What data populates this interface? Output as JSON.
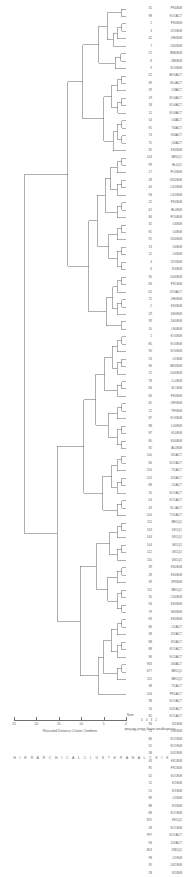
{
  "chart_data": {
    "type": "dendrogram",
    "title": "Dendrogram using Ward Method",
    "xlabel": "Rescaled Distance Cluster Combine",
    "ylabel": "",
    "grid": false,
    "legend": "none",
    "axis": {
      "ticks": [
        25,
        20,
        15,
        10,
        5,
        0
      ],
      "tick_labels": [
        "25",
        "20",
        "15",
        "10",
        "5",
        "0"
      ],
      "range": [
        25,
        0
      ],
      "direction": "right-to-left",
      "pixel_left": 14,
      "pixel_right": 126
    },
    "leaf_count": 93,
    "label_columns": [
      "Num",
      "Label"
    ],
    "leaves": [
      {
        "code": "31",
        "name": "PK0808"
      },
      {
        "code": "98",
        "name": "KO1ACT"
      },
      {
        "code": "1",
        "name": "PK0808"
      },
      {
        "code": "3",
        "name": "ZO0808"
      },
      {
        "code": "42",
        "name": "ZH0808"
      },
      {
        "code": "7",
        "name": "UU0808"
      },
      {
        "code": "21",
        "name": "BM0808"
      },
      {
        "code": "8",
        "name": "JM0808"
      },
      {
        "code": "9",
        "name": "KO0808"
      },
      {
        "code": "52",
        "name": "BO5ACT"
      },
      {
        "code": "39",
        "name": "KL0ACT"
      },
      {
        "code": "29",
        "name": "LI3ACT"
      },
      {
        "code": "19",
        "name": "KO4ACT"
      },
      {
        "code": "18",
        "name": "KO4ACT"
      },
      {
        "code": "11",
        "name": "KO4ACT"
      },
      {
        "code": "54",
        "name": "LI4ACT"
      },
      {
        "code": "91",
        "name": "TI4ACT"
      },
      {
        "code": "74",
        "name": "KI4ACT"
      },
      {
        "code": "75",
        "name": "LI0ACT"
      },
      {
        "code": "35",
        "name": "KK0808"
      },
      {
        "code": "103",
        "name": "MK0Q1"
      },
      {
        "code": "99",
        "name": "BL0Q1"
      },
      {
        "code": "17",
        "name": "PO0808"
      },
      {
        "code": "28",
        "name": "UI1D808"
      },
      {
        "code": "44",
        "name": "LI1D808"
      },
      {
        "code": "58",
        "name": "LI1D808"
      },
      {
        "code": "22",
        "name": "PK0808"
      },
      {
        "code": "62",
        "name": "BL0808"
      },
      {
        "code": "84",
        "name": "PO0808"
      },
      {
        "code": "32",
        "name": "LI0808"
      },
      {
        "code": "81",
        "name": "LI0808"
      },
      {
        "code": "91",
        "name": "UU0808"
      },
      {
        "code": "13",
        "name": "LI0808"
      },
      {
        "code": "11",
        "name": "LI0808"
      },
      {
        "code": "4",
        "name": "UT0808"
      },
      {
        "code": "6",
        "name": "KI0808"
      },
      {
        "code": "90",
        "name": "DU0808"
      },
      {
        "code": "83",
        "name": "PK1808"
      },
      {
        "code": "61",
        "name": "ZO0ACT"
      },
      {
        "code": "71",
        "name": "ZH0808"
      },
      {
        "code": "2",
        "name": "KK0808"
      },
      {
        "code": "29",
        "name": "DK0808"
      },
      {
        "code": "39",
        "name": "DK0808"
      },
      {
        "code": "10",
        "name": "LK0808"
      },
      {
        "code": "1",
        "name": "KO0808"
      },
      {
        "code": "85",
        "name": "KO0808"
      },
      {
        "code": "90",
        "name": "KO0808"
      },
      {
        "code": "23",
        "name": "LI1808"
      },
      {
        "code": "96",
        "name": "MU0808"
      },
      {
        "code": "12",
        "name": "DU0808"
      },
      {
        "code": "78",
        "name": "LL0808"
      },
      {
        "code": "84",
        "name": "SL1808"
      },
      {
        "code": "66",
        "name": "PK0808"
      },
      {
        "code": "65",
        "name": "DP0808"
      },
      {
        "code": "12",
        "name": "TP0808"
      },
      {
        "code": "87",
        "name": "KO0808"
      },
      {
        "code": "88",
        "name": "LU0808"
      },
      {
        "code": "87",
        "name": "KL0808"
      },
      {
        "code": "80",
        "name": "KU0808"
      },
      {
        "code": "92",
        "name": "AL0808"
      },
      {
        "code": "100",
        "name": "DI1ACT"
      },
      {
        "code": "84",
        "name": "KO1ACT"
      },
      {
        "code": "150",
        "name": "TI1ACT"
      },
      {
        "code": "102",
        "name": "DI1ACT"
      },
      {
        "code": "88",
        "name": "LI1ACT"
      },
      {
        "code": "20",
        "name": "KO1ACT"
      },
      {
        "code": "64",
        "name": "KO1ACT"
      },
      {
        "code": "43",
        "name": "KL1ACT"
      },
      {
        "code": "100",
        "name": "TU1ACT"
      },
      {
        "code": "111",
        "name": "MK1Q1"
      },
      {
        "code": "113",
        "name": "DK1Q1"
      },
      {
        "code": "103",
        "name": "DK1Q1"
      },
      {
        "code": "104",
        "name": "SK1Q1"
      },
      {
        "code": "112",
        "name": "UK1Q1"
      },
      {
        "code": "110",
        "name": "DK1Q1"
      },
      {
        "code": "39",
        "name": "KK0808"
      },
      {
        "code": "28",
        "name": "KK0808"
      },
      {
        "code": "39",
        "name": "ZP0808"
      },
      {
        "code": "111",
        "name": "MK1Q1"
      },
      {
        "code": "30",
        "name": "CU0808"
      },
      {
        "code": "94",
        "name": "KK0808"
      },
      {
        "code": "79",
        "name": "SK0808"
      },
      {
        "code": "83",
        "name": "KK0808"
      },
      {
        "code": "86",
        "name": "LI1ACT"
      },
      {
        "code": "38",
        "name": "DI1ACT"
      },
      {
        "code": "88",
        "name": "KI1ACT"
      },
      {
        "code": "88",
        "name": "KO1ACT"
      },
      {
        "code": "96",
        "name": "KO1ACT"
      },
      {
        "code": "943",
        "name": "DI0ACT"
      },
      {
        "code": "677",
        "name": "MK1Q1"
      },
      {
        "code": "211",
        "name": "MK1Q1"
      },
      {
        "code": "38",
        "name": "TI1ACT"
      },
      {
        "code": "103",
        "name": "PK1ACT"
      },
      {
        "code": "38",
        "name": "KO1ACT"
      },
      {
        "code": "16",
        "name": "DU1ACT"
      },
      {
        "code": "65",
        "name": "KO1ACT"
      },
      {
        "code": "94",
        "name": "DI1808"
      },
      {
        "code": "73",
        "name": "LU1808"
      },
      {
        "code": "86",
        "name": "KO1808"
      },
      {
        "code": "52",
        "name": "KO1808"
      },
      {
        "code": "58",
        "name": "DU1808"
      },
      {
        "code": "43",
        "name": "KK1808"
      },
      {
        "code": "95",
        "name": "PK1808"
      },
      {
        "code": "52",
        "name": "SO1808"
      },
      {
        "code": "11",
        "name": "KI1808"
      },
      {
        "code": "51",
        "name": "KI1808"
      },
      {
        "code": "89",
        "name": "LI1808"
      },
      {
        "code": "88",
        "name": "KI1808"
      },
      {
        "code": "88",
        "name": "KO1808"
      },
      {
        "code": "870",
        "name": "KK1Q1"
      },
      {
        "code": "18",
        "name": "KO1808"
      },
      {
        "code": "997",
        "name": "KO1ACT"
      },
      {
        "code": "94",
        "name": "DI1ACT"
      },
      {
        "code": "803",
        "name": "ZM1Q1"
      },
      {
        "code": "98",
        "name": "LI1808"
      },
      {
        "code": "95",
        "name": "UU1808"
      },
      {
        "code": "28",
        "name": "KI1808"
      }
    ]
  },
  "axis": {
    "tick_labels": [
      "25",
      "20",
      "15",
      "10",
      "5",
      "0"
    ],
    "title": "Rescaled Distance Cluster Combine"
  },
  "title": {
    "text": "Dendrogram using Ward Method"
  },
  "cluster_strip": {
    "label": "Num",
    "numbers": "5 4 3 2"
  },
  "footer": {
    "text": "H I E R A R C H I C A L   C L U S T E R   A N A L Y S I S"
  },
  "colors": {
    "line": "#6e6e6e",
    "text": "#5a5a5a",
    "background": "#ffffff"
  }
}
